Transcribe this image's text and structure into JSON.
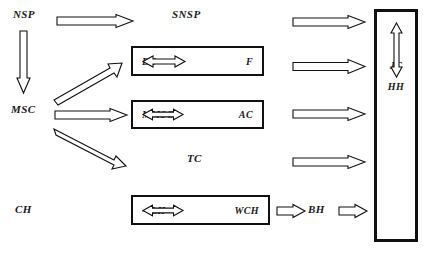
{
  "diagram": {
    "title": "",
    "canvas": {
      "width": 423,
      "height": 253
    },
    "colors": {
      "stroke": "#111111",
      "text": "#1a1a1a",
      "fill": "#ffffff"
    },
    "labels": [
      {
        "id": "nsp",
        "text": "NSP",
        "x": 13,
        "y": 8,
        "size": 11
      },
      {
        "id": "snsp",
        "text": "SNSP",
        "x": 172,
        "y": 8,
        "size": 11
      },
      {
        "id": "msc",
        "text": "MSC",
        "x": 11,
        "y": 103,
        "size": 11
      },
      {
        "id": "tc",
        "text": "TC",
        "x": 187,
        "y": 152,
        "size": 11
      },
      {
        "id": "ch",
        "text": "CH",
        "x": 15,
        "y": 203,
        "size": 11
      },
      {
        "id": "bh",
        "text": "BH",
        "x": 308,
        "y": 203,
        "size": 11
      }
    ],
    "boxes": [
      {
        "id": "bc-f",
        "left": 4,
        "right": "F",
        "relation": "double-arrow",
        "x": 131,
        "y": 46,
        "w": 133,
        "h": 30
      },
      {
        "id": "mmsc-ac",
        "left": "MMSC",
        "right": "AC",
        "relation": "double-arrow",
        "x": 131,
        "y": 100,
        "w": 133,
        "h": 29
      },
      {
        "id": "lh-wch",
        "left": "~ LH",
        "right": "WCH",
        "relation": "double-arrow",
        "x": 131,
        "y": 195,
        "w": 139,
        "h": 30
      }
    ],
    "box_labels": {
      "bc": "BC",
      "f": "F",
      "mmsc": "MMSC",
      "ac": "AC",
      "lh": "~ LH",
      "wch": "WCH"
    },
    "tall_box": {
      "id": "jc-hh",
      "x": 374,
      "y": 9,
      "w": 44,
      "h": 233,
      "top_label": "JC",
      "bottom_label": "HH",
      "relation": "vertical-double-arrow"
    },
    "arrows": [
      {
        "id": "nsp-to-snsp",
        "kind": "outline-right",
        "x": 56,
        "y": 14,
        "len": 76,
        "thick": 8
      },
      {
        "id": "nsp-to-msc",
        "kind": "outline-down",
        "x": 16,
        "y": 30,
        "len": 62,
        "thick": 9
      },
      {
        "id": "msc-to-bc",
        "kind": "outline-diag-up",
        "x": 54,
        "y": 66,
        "dx": 62,
        "dy": -38,
        "thick": 9
      },
      {
        "id": "msc-to-mmsc",
        "kind": "outline-right",
        "x": 54,
        "y": 108,
        "len": 72,
        "thick": 8
      },
      {
        "id": "msc-to-lh",
        "kind": "outline-diag-down",
        "x": 54,
        "y": 124,
        "dx": 66,
        "dy": 42,
        "thick": 9
      },
      {
        "id": "snsp-to-jc",
        "kind": "outline-right",
        "x": 292,
        "y": 15,
        "len": 72,
        "thick": 8
      },
      {
        "id": "f-to-jc",
        "kind": "outline-right",
        "x": 292,
        "y": 59,
        "len": 72,
        "thick": 9
      },
      {
        "id": "ac-to-jc",
        "kind": "outline-right",
        "x": 292,
        "y": 107,
        "len": 72,
        "thick": 8
      },
      {
        "id": "tc-to-hh",
        "kind": "outline-right",
        "x": 292,
        "y": 155,
        "len": 72,
        "thick": 8
      },
      {
        "id": "wch-to-bh",
        "kind": "outline-right",
        "x": 276,
        "y": 204,
        "len": 28,
        "thick": 8
      },
      {
        "id": "bh-to-hh",
        "kind": "outline-right",
        "x": 338,
        "y": 204,
        "len": 28,
        "thick": 8
      }
    ]
  }
}
